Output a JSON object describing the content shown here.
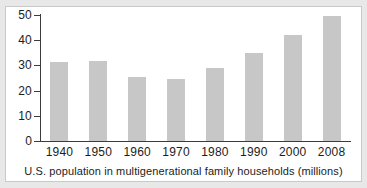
{
  "figure": {
    "caption": "U.S. population in multigenerational family households (millions)",
    "background_color": "#e8e8e8",
    "panel_color": "#ffffff",
    "border_color": "#c9c9c9",
    "bar_color": "#c7c7c7",
    "axis_color": "#3c3c3c",
    "text_color": "#1c1c1c"
  },
  "chart_data": {
    "type": "bar",
    "title": "",
    "subtitle": "",
    "xlabel": "U.S. population in multigenerational family households (millions)",
    "ylabel": "",
    "categories": [
      "1940",
      "1950",
      "1960",
      "1970",
      "1980",
      "1990",
      "2000",
      "2008"
    ],
    "values": [
      31.5,
      31.8,
      25.3,
      24.6,
      28.8,
      35.0,
      42.0,
      49.5
    ],
    "series": [
      {
        "name": "U.S. population in multigenerational family households (millions)",
        "values": [
          31.5,
          31.8,
          25.3,
          24.6,
          28.8,
          35.0,
          42.0,
          49.5
        ]
      }
    ],
    "ylim": [
      0,
      50
    ],
    "yticks": [
      0,
      10,
      20,
      30,
      40,
      50
    ],
    "ytick_labels": [
      "0",
      "10",
      "20",
      "30",
      "40",
      "50"
    ],
    "xtick_labels": [
      "1940",
      "1950",
      "1960",
      "1970",
      "1980",
      "1990",
      "2000",
      "2008"
    ],
    "grid": false,
    "legend": false,
    "legend_position": "none",
    "annotations": []
  }
}
